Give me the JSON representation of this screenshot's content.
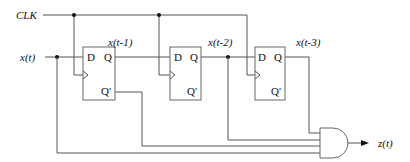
{
  "diagram": {
    "type": "sequential-logic-circuit",
    "inputs": {
      "clock": "CLK",
      "data": "x(t)"
    },
    "flip_flops": [
      {
        "id": "ff1",
        "d_label": "D",
        "q_label": "Q",
        "qn_label": "Q'",
        "output_signal": "x(t-1)"
      },
      {
        "id": "ff2",
        "d_label": "D",
        "q_label": "Q",
        "qn_label": "Q'",
        "output_signal": "x(t-2)"
      },
      {
        "id": "ff3",
        "d_label": "D",
        "q_label": "Q",
        "qn_label": "Q'",
        "output_signal": "x(t-3)"
      }
    ],
    "gate": {
      "type": "AND",
      "inputs": [
        "x(t-3)",
        "x'(t-1)",
        "x(t-2)",
        "x(t)"
      ]
    },
    "output": "z(t)",
    "colors": {
      "wire": "#555555",
      "text": "#111111",
      "background": "#ffffff"
    }
  }
}
